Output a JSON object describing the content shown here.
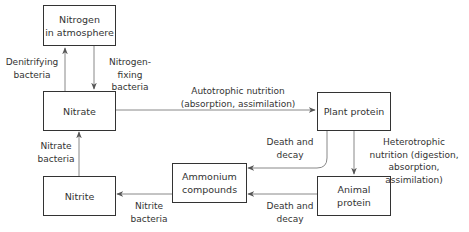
{
  "nodes": {
    "atmosphere": "Nitrogen\nin atmosphere",
    "nitrate": "Nitrate",
    "nitrite": "Nitrite",
    "plant_protein": "Plant protein",
    "ammonium": "Ammonium\ncompounds",
    "animal_protein": "Animal\nprotein"
  },
  "edges": {
    "denitrifying": "Denitrifying\nbacteria",
    "nitrogen_fixing": "Nitrogen-fixing\nbacteria",
    "nitrate_bacteria": "Nitrate\nbacteria",
    "nitrite_bacteria": "Nitrite\nbacteria",
    "autotrophic": "Autotrophic nutrition\n(absorption, assimilation)",
    "heterotrophic": "Heterotrophic\nnutrition (digestion,\nabsorption, assimilation)",
    "death_decay_plant": "Death and\ndecay",
    "death_decay_animal": "Death and\ndecay"
  },
  "colors": {
    "line": "#888888",
    "border": "#333333",
    "text": "#333333"
  }
}
